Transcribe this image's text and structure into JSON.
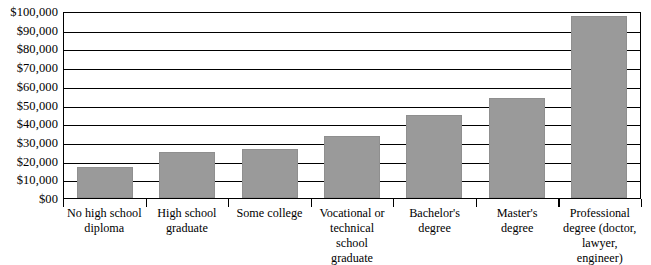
{
  "chart_data": {
    "type": "bar",
    "title": "",
    "subtitle": "",
    "xlabel": "",
    "ylabel": "",
    "ylim": [
      0,
      100000
    ],
    "grid": true,
    "legend": false,
    "bar_color": "#9a9a9a",
    "frame_color": "#000000",
    "background_color": "#ffffff",
    "categories": [
      "No high school diploma",
      "High school graduate",
      "Some college",
      "Vocational or technical school graduate",
      "Bachelor's degree",
      "Master's degree",
      "Professional degree (doctor, lawyer, engineer)"
    ],
    "category_lines": [
      [
        "No high school",
        "diploma"
      ],
      [
        "High school",
        "graduate"
      ],
      [
        "Some college"
      ],
      [
        "Vocational or",
        "technical school",
        "graduate"
      ],
      [
        "Bachelor's",
        "degree"
      ],
      [
        "Master's",
        "degree"
      ],
      [
        "Professional",
        "degree (doctor,",
        "lawyer, engineer)"
      ]
    ],
    "values": [
      16600,
      24600,
      26200,
      33200,
      44400,
      53500,
      97300
    ],
    "y_ticks": [
      0,
      10000,
      20000,
      30000,
      40000,
      50000,
      60000,
      70000,
      80000,
      90000,
      100000
    ],
    "y_tick_labels": [
      "$00",
      "$10,000",
      "$20,000",
      "$30,000",
      "$40,000",
      "$50,000",
      "$60,000",
      "$70,000",
      "$80,000",
      "$90,000",
      "$100,000"
    ]
  }
}
